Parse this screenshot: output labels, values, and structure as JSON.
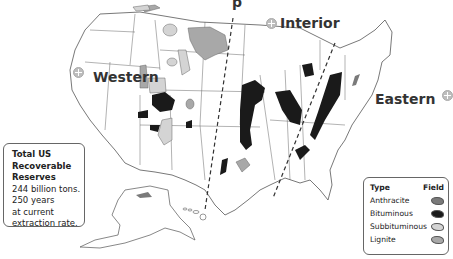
{
  "map": {
    "title_fragment": "p",
    "regions": [
      {
        "name": "Western",
        "icon": "plus-circle-icon"
      },
      {
        "name": "Interior",
        "icon": "plus-circle-icon"
      },
      {
        "name": "Eastern",
        "icon": "plus-circle-icon"
      }
    ]
  },
  "info_box": {
    "heading_lines": [
      "Total US",
      "Recoverable",
      "Reserves"
    ],
    "body_lines": [
      "244 billion tons.",
      "250 years",
      "at current",
      "extraction rate."
    ]
  },
  "legend": {
    "col_type": "Type",
    "col_field": "Field",
    "items": [
      {
        "label": "Anthracite",
        "color": "#7a7a7a"
      },
      {
        "label": "Bituminous",
        "color": "#1a1a1a"
      },
      {
        "label": "Subbituminous",
        "color": "#d4d4d4"
      },
      {
        "label": "Lignite",
        "color": "#a8a8a8"
      }
    ]
  },
  "colors": {
    "border": "#555555",
    "anthracite": "#7a7a7a",
    "bituminous": "#1a1a1a",
    "subbituminous": "#d4d4d4",
    "lignite": "#a8a8a8"
  }
}
